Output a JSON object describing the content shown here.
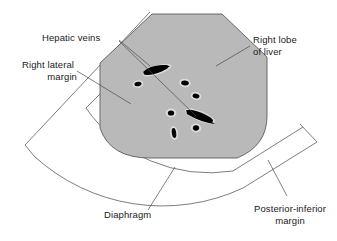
{
  "figure": {
    "type": "medical-illustration",
    "background_color": "#ffffff",
    "liver_fill_color": "#b9b9b9",
    "liver_outline_color": "#5c5c5c",
    "vein_color": "#000000",
    "vein_halo_color": "#d8d8d8",
    "leader_line_color": "#4a4a4a",
    "text_color": "#1b1b1b",
    "diaphragm_band_color": "#ffffff"
  },
  "labels": {
    "hepatic_veins": {
      "line1": "Hepatic veins",
      "line2": "",
      "x": 42,
      "y": 41,
      "anchor": "start"
    },
    "right_lateral_margin": {
      "line1": "Right lateral",
      "line2": "margin",
      "x": 22,
      "y": 68,
      "anchor": "start"
    },
    "right_lobe_of_liver": {
      "line1": "Right lobe",
      "line2": "of liver",
      "x": 253,
      "y": 43,
      "anchor": "start"
    },
    "diaphragm": {
      "line1": "Diaphragm",
      "line2": "",
      "x": 104,
      "y": 218,
      "anchor": "start"
    },
    "posterior_inferior_margin": {
      "line1": "Posterior-inferior",
      "line2": "margin",
      "x": 290,
      "y": 212,
      "anchor": "middle"
    }
  },
  "structures": {
    "liver_lobe": "Right lobe of liver",
    "sector_field": "Ultrasound sector scan field",
    "diaphragm_band": "Diaphragm",
    "hepatic_veins_count": 10
  },
  "veins": [
    {
      "name": "large-vein-upper",
      "cx": 157,
      "cy": 70,
      "rx": 14,
      "ry": 3.6,
      "rot": -18,
      "kind": "large"
    },
    {
      "name": "large-vein-lower",
      "cx": 200,
      "cy": 116,
      "rx": 15,
      "ry": 4.0,
      "rot": 22,
      "kind": "large"
    },
    {
      "name": "small-vein-a",
      "cx": 138,
      "cy": 84,
      "rx": 4.2,
      "ry": 2.6,
      "rot": -10,
      "kind": "small"
    },
    {
      "name": "small-vein-b",
      "cx": 185,
      "cy": 83,
      "rx": 4.6,
      "ry": 3.0,
      "rot": 8,
      "kind": "small"
    },
    {
      "name": "small-vein-c",
      "cx": 196,
      "cy": 96,
      "rx": 4.2,
      "ry": 2.8,
      "rot": 12,
      "kind": "small"
    },
    {
      "name": "small-vein-d",
      "cx": 171,
      "cy": 113,
      "rx": 4.0,
      "ry": 3.0,
      "rot": 0,
      "kind": "small"
    },
    {
      "name": "small-vein-e",
      "cx": 196,
      "cy": 128,
      "rx": 4.0,
      "ry": 3.2,
      "rot": 5,
      "kind": "small"
    },
    {
      "name": "small-vein-f",
      "cx": 174,
      "cy": 133,
      "rx": 2.8,
      "ry": 5.6,
      "rot": -8,
      "kind": "small"
    }
  ]
}
